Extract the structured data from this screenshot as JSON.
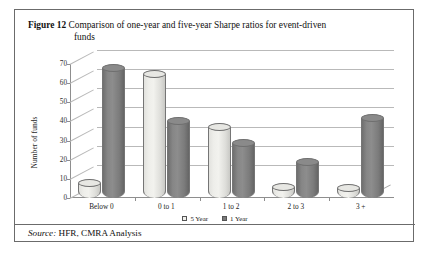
{
  "figure": {
    "label": "Figure 12",
    "caption_line1": "Comparison of one-year and five-year Sharpe ratios for event-driven",
    "caption_line2": "funds"
  },
  "source": {
    "keyword": "Source:",
    "text": "HFR, CMRA Analysis"
  },
  "legend": {
    "items": [
      {
        "label": "5 Year",
        "color": "#f0f0ec"
      },
      {
        "label": "1 Year",
        "color": "#7b7b7b"
      }
    ]
  },
  "axes": {
    "y_title": "Number of funds",
    "y_ticks": [
      "0",
      "10",
      "20",
      "30",
      "40",
      "50",
      "60",
      "70"
    ],
    "x_ticks": [
      "Below 0",
      "0 to 1",
      "1 to 2",
      "2 to 3",
      "3 +"
    ]
  },
  "chart_data": {
    "type": "bar",
    "title": "Comparison of one-year and five-year Sharpe ratios for event-driven funds",
    "xlabel": "",
    "ylabel": "Number of funds",
    "ylim": [
      0,
      70
    ],
    "ytick_step": 10,
    "grid": true,
    "legend_position": "bottom-center",
    "style": "3d-cylinder",
    "categories": [
      "Below 0",
      "0 to 1",
      "1 to 2",
      "2 to 3",
      "3 +"
    ],
    "series": [
      {
        "name": "5 Year",
        "color": "#f0f0ec",
        "values": [
          8,
          65,
          37,
          6,
          5
        ]
      },
      {
        "name": "1 Year",
        "color": "#7b7b7b",
        "values": [
          68,
          40,
          29,
          19,
          42
        ]
      }
    ]
  }
}
